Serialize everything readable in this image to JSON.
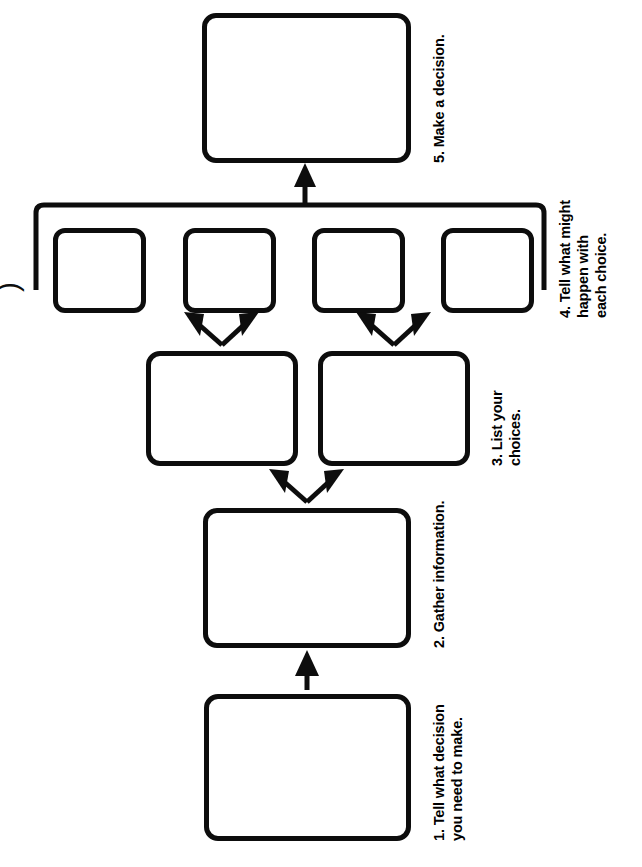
{
  "document": {
    "title": "Decision Making Graphic Organizer",
    "orientation": "rotated-90",
    "background_color": "#ffffff",
    "ink_color": "#0d0d0d",
    "edge_glyph": ")"
  },
  "steps": [
    {
      "number": "1.",
      "label": "1. Tell what decision\nyou need to make.",
      "lines": [
        "1. Tell what decision",
        "you need to make."
      ],
      "box_count": 1
    },
    {
      "number": "2.",
      "label": "2. Gather information.",
      "lines": [
        "2. Gather information."
      ],
      "box_count": 1
    },
    {
      "number": "3.",
      "label": "3. List your\nchoices.",
      "lines": [
        "3. List your",
        "choices."
      ],
      "box_count": 2
    },
    {
      "number": "4.",
      "label": "4. Tell what might\nhappen with\neach choice.",
      "lines": [
        "4. Tell what might",
        "happen with",
        "each choice."
      ],
      "box_count": 4
    },
    {
      "number": "5.",
      "label": "5. Make a decision.",
      "lines": [
        "5. Make a decision."
      ],
      "box_count": 1
    }
  ],
  "connectors": {
    "step1_to_step2": "single-arrow",
    "step2_to_step3": "split-double-arrow",
    "step3a_to_outcomes": "split-double-arrow",
    "step3b_to_outcomes": "split-double-arrow",
    "outcomes_to_step5": "bracket-with-arrow"
  }
}
